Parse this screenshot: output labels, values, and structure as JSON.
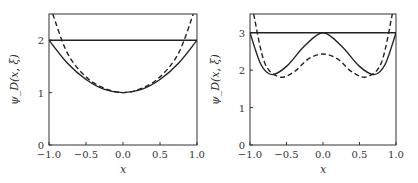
{
  "chart_data": [
    {
      "type": "line",
      "panel": "left",
      "xlabel": "x",
      "ylabel": "ψ_D(x, ξ)",
      "xlim": [
        -1.0,
        1.0
      ],
      "ylim": [
        0,
        2.5
      ],
      "xticks": [
        "-1.0",
        "-0.5",
        "0.0",
        "0.5",
        "1.0"
      ],
      "yticks": [
        "0",
        "1",
        "2"
      ],
      "grid": false,
      "series": [
        {
          "name": "horizontal level",
          "style": "solid",
          "x": [
            -1.0,
            1.0
          ],
          "y": [
            2.0,
            2.0
          ]
        },
        {
          "name": "solid curve",
          "style": "solid",
          "x": [
            -1.0,
            -0.75,
            -0.5,
            -0.25,
            0.0,
            0.25,
            0.5,
            0.75,
            1.0
          ],
          "y": [
            2.0,
            1.56,
            1.25,
            1.06,
            1.0,
            1.06,
            1.25,
            1.56,
            2.0
          ]
        },
        {
          "name": "dashed curve",
          "style": "dashed",
          "x": [
            -0.95,
            -0.75,
            -0.5,
            -0.25,
            0.0,
            0.25,
            0.5,
            0.75,
            0.95
          ],
          "y": [
            2.5,
            1.75,
            1.3,
            1.08,
            1.0,
            1.08,
            1.3,
            1.75,
            2.5
          ]
        }
      ]
    },
    {
      "type": "line",
      "panel": "right",
      "xlabel": "x",
      "ylabel": "ψ_D(x, ξ)",
      "xlim": [
        -1.0,
        1.0
      ],
      "ylim": [
        0,
        3.5
      ],
      "xticks": [
        "-1.0",
        "-0.5",
        "0.0",
        "0.5",
        "1.0"
      ],
      "yticks": [
        "0",
        "1",
        "2",
        "3"
      ],
      "grid": false,
      "series": [
        {
          "name": "horizontal level",
          "style": "solid",
          "x": [
            -1.0,
            1.0
          ],
          "y": [
            3.0,
            3.0
          ]
        },
        {
          "name": "solid curve",
          "style": "solid",
          "x": [
            -1.0,
            -0.85,
            -0.7,
            -0.5,
            -0.25,
            0.0,
            0.25,
            0.5,
            0.7,
            0.85,
            1.0
          ],
          "y": [
            3.0,
            2.15,
            1.88,
            2.1,
            2.65,
            3.0,
            2.65,
            2.1,
            1.88,
            2.15,
            3.0
          ]
        },
        {
          "name": "dashed curve",
          "style": "dashed",
          "x": [
            -0.95,
            -0.8,
            -0.6,
            -0.4,
            -0.2,
            0.0,
            0.2,
            0.4,
            0.6,
            0.8,
            0.95
          ],
          "y": [
            3.5,
            2.2,
            1.82,
            1.95,
            2.3,
            2.43,
            2.3,
            1.95,
            1.82,
            2.2,
            3.5
          ]
        }
      ]
    }
  ]
}
